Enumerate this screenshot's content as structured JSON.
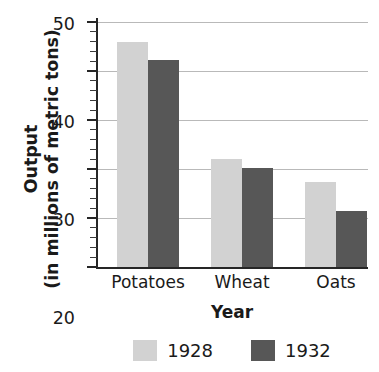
{
  "chart_data": {
    "type": "bar",
    "title": "",
    "xlabel": "Year",
    "ylabel_line1": "Output",
    "ylabel_line2": "(in millions of metric tons)",
    "categories": [
      "Potatoes",
      "Wheat",
      "Oats"
    ],
    "series": [
      {
        "name": "1928",
        "color": "#d2d2d2",
        "values": [
          46,
          22,
          17.3
        ]
      },
      {
        "name": "1932",
        "color": "#575757",
        "values": [
          42.3,
          20.3,
          11.5
        ]
      }
    ],
    "ylim": [
      0,
      50
    ],
    "ytick_labels": [
      "0",
      "10",
      "20",
      "30",
      "40",
      "50"
    ],
    "ytick_values": [
      0,
      10,
      20,
      30,
      40,
      50
    ],
    "yminor_step": 2,
    "grid": true,
    "grid_axis": "y",
    "grid_color": "#b9b9b9",
    "axis_color": "#262626",
    "legend_position": "bottom",
    "background": "#ffffff"
  },
  "legend": {
    "items": [
      {
        "label": "1928",
        "color": "#d2d2d2"
      },
      {
        "label": "1932",
        "color": "#575757"
      }
    ]
  },
  "axes": {
    "y_title_line1": "Output",
    "y_title_line2": "(in millions of metric tons)",
    "x_title": "Year",
    "y_ticks": [
      "50",
      "40",
      "30",
      "20",
      "10",
      "0"
    ],
    "x_ticks": [
      "Potatoes",
      "Wheat",
      "Oats"
    ]
  }
}
